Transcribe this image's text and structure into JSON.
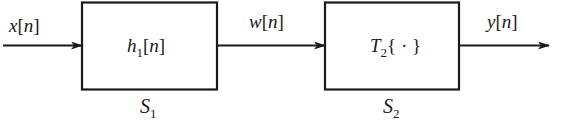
{
  "diagram": {
    "type": "block-diagram",
    "signals": {
      "input": {
        "name": "x",
        "index": "n"
      },
      "intermediate": {
        "name": "w",
        "index": "n"
      },
      "output": {
        "name": "y",
        "index": "n"
      }
    },
    "blocks": [
      {
        "id": "S1",
        "label_base": "S",
        "label_sub": "1",
        "content_base": "h",
        "content_sub": "1",
        "content_tail": "[n]"
      },
      {
        "id": "S2",
        "label_base": "S",
        "label_sub": "2",
        "content_base": "T",
        "content_sub": "2",
        "content_tail": "{ · }"
      }
    ],
    "colors": {
      "stroke": "#1a1a1a",
      "background": "#ffffff"
    }
  }
}
